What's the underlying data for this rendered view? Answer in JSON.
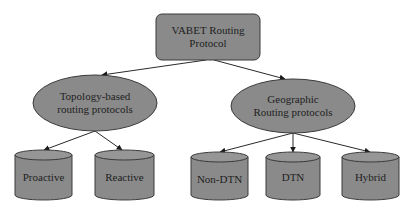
{
  "diagram": {
    "colors": {
      "fill": "#8a8a8a",
      "fill_top": "#969696",
      "stroke": "#3a3a3a",
      "edge": "#2a2a2a",
      "text": "#1e1e1e",
      "background": "#ffffff"
    },
    "root": {
      "shape": "rounded-rectangle",
      "line1": "VABET Routing",
      "line2": "Protocol"
    },
    "categories": [
      {
        "shape": "ellipse",
        "line1": "Topology-based",
        "line2": "routing protocols",
        "children": [
          {
            "shape": "cylinder",
            "label": "Proactive"
          },
          {
            "shape": "cylinder",
            "label": "Reactive"
          }
        ]
      },
      {
        "shape": "ellipse",
        "line1": "Geographic",
        "line2": "Routing protocols",
        "children": [
          {
            "shape": "cylinder",
            "label": "Non-DTN"
          },
          {
            "shape": "cylinder",
            "label": "DTN"
          },
          {
            "shape": "cylinder",
            "label": "Hybrid"
          }
        ]
      }
    ]
  }
}
